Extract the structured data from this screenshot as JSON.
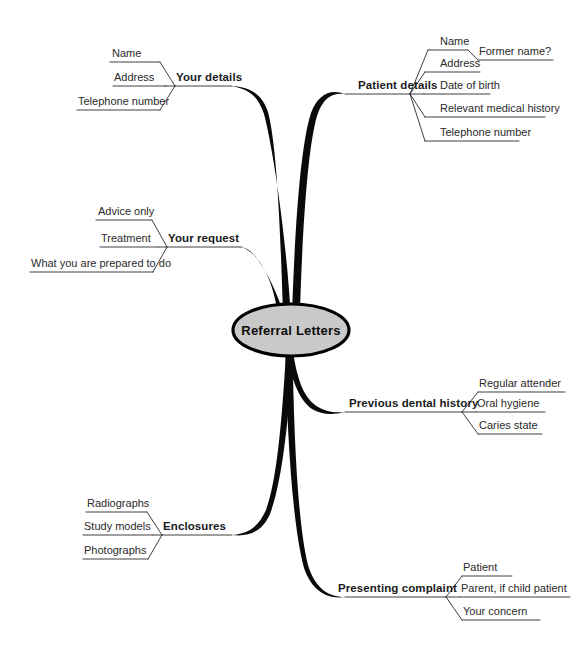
{
  "diagram": {
    "type": "mind-map",
    "title": "Referral Letters",
    "center": {
      "label": "Referral Letters",
      "shape": "ellipse",
      "fill_color": "#c9c9c9",
      "border_color": "#000000"
    },
    "branches": [
      {
        "id": "your-details",
        "label": "Your details",
        "side": "left",
        "children": [
          {
            "label": "Name"
          },
          {
            "label": "Address"
          },
          {
            "label": "Telephone number"
          }
        ]
      },
      {
        "id": "patient-details",
        "label": "Patient details",
        "side": "right",
        "children": [
          {
            "label": "Name",
            "children": [
              {
                "label": "Former name?"
              }
            ]
          },
          {
            "label": "Address"
          },
          {
            "label": "Date of birth"
          },
          {
            "label": "Relevant medical history"
          },
          {
            "label": "Telephone number"
          }
        ]
      },
      {
        "id": "your-request",
        "label": "Your request",
        "side": "left",
        "children": [
          {
            "label": "Advice only"
          },
          {
            "label": "Treatment"
          },
          {
            "label": "What you are prepared to do"
          }
        ]
      },
      {
        "id": "previous-dental-history",
        "label": "Previous dental history",
        "side": "right",
        "children": [
          {
            "label": "Regular attender"
          },
          {
            "label": "Oral hygiene"
          },
          {
            "label": "Caries state"
          }
        ]
      },
      {
        "id": "enclosures",
        "label": "Enclosures",
        "side": "left",
        "children": [
          {
            "label": "Radiographs"
          },
          {
            "label": "Study models"
          },
          {
            "label": "Photographs"
          }
        ]
      },
      {
        "id": "presenting-complaint",
        "label": "Presenting complaint",
        "side": "right",
        "children": [
          {
            "label": "Patient"
          },
          {
            "label": "Parent, if child patient"
          },
          {
            "label": "Your concern"
          }
        ]
      }
    ]
  }
}
